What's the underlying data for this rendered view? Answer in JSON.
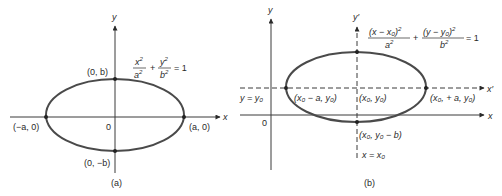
{
  "panel_a": {
    "caption": "(a)",
    "axes": {
      "x_label": "x",
      "y_label": "y",
      "origin_label": "0"
    },
    "equation": {
      "term1_num": "x",
      "term1_num_exp": "2",
      "term1_den": "a",
      "term1_den_exp": "2",
      "plus": "+",
      "term2_num": "y",
      "term2_num_exp": "2",
      "term2_den": "b",
      "term2_den_exp": "2",
      "rhs": "= 1"
    },
    "points": {
      "top": "(0, b)",
      "bottom": "(0, −b)",
      "left": "(−a, 0)",
      "right": "(a, 0)"
    }
  },
  "panel_b": {
    "caption": "(b)",
    "axes": {
      "x_label": "x",
      "y_label": "y",
      "xprime_label": "x′",
      "yprime_label": "y′",
      "origin_label": "0"
    },
    "equation": {
      "term1_num": "(x − x₀)",
      "term1_num_exp": "2",
      "term1_den": "a",
      "term1_den_exp": "2",
      "plus": "+",
      "term2_num": "(y − y₀)",
      "term2_num_exp": "2",
      "term2_den": "b",
      "term2_den_exp": "2",
      "rhs": "= 1"
    },
    "lines": {
      "horizontal": "y = y₀",
      "vertical": "x = x₀"
    },
    "points": {
      "center": "(x₀, y₀)",
      "left": "(x₀ − a, y₀)",
      "right": "(x₀, + a, y₀)",
      "bottom": "(x₀, y₀ − b)"
    }
  }
}
